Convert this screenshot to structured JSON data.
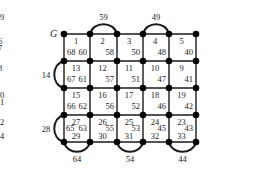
{
  "diagram": {
    "start_label": "G",
    "grid": {
      "cols_x": [
        64,
        90,
        117,
        143,
        169,
        196
      ],
      "rows_y": [
        34,
        61,
        88,
        115,
        142
      ]
    },
    "cells": [
      {
        "row": 0,
        "col": 0,
        "labels": [
          {
            "t": "1",
            "pos": "top"
          },
          {
            "t": "68",
            "pos": "bl"
          },
          {
            "t": "60",
            "pos": "br"
          }
        ]
      },
      {
        "row": 0,
        "col": 1,
        "labels": [
          {
            "t": "2",
            "pos": "top"
          },
          {
            "t": "58",
            "pos": "br"
          }
        ]
      },
      {
        "row": 0,
        "col": 2,
        "labels": [
          {
            "t": "3",
            "pos": "top"
          },
          {
            "t": "50",
            "pos": "br"
          }
        ]
      },
      {
        "row": 0,
        "col": 3,
        "labels": [
          {
            "t": "4",
            "pos": "top"
          },
          {
            "t": "48",
            "pos": "br"
          }
        ]
      },
      {
        "row": 0,
        "col": 4,
        "labels": [
          {
            "t": "5",
            "pos": "top"
          },
          {
            "t": "40",
            "pos": "br"
          }
        ]
      },
      {
        "row": 0,
        "col": 5,
        "labels": [
          {
            "t": "6",
            "pos": "top"
          },
          {
            "t": "38",
            "pos": "br"
          }
        ]
      },
      {
        "row": 1,
        "col": 0,
        "labels": [
          {
            "t": "13",
            "pos": "top"
          },
          {
            "t": "67",
            "pos": "bl"
          },
          {
            "t": "61",
            "pos": "br"
          }
        ]
      },
      {
        "row": 1,
        "col": 1,
        "labels": [
          {
            "t": "12",
            "pos": "top"
          },
          {
            "t": "57",
            "pos": "br"
          }
        ]
      },
      {
        "row": 1,
        "col": 2,
        "labels": [
          {
            "t": "11",
            "pos": "top"
          },
          {
            "t": "51",
            "pos": "br"
          }
        ]
      },
      {
        "row": 1,
        "col": 3,
        "labels": [
          {
            "t": "10",
            "pos": "top"
          },
          {
            "t": "47",
            "pos": "br"
          }
        ]
      },
      {
        "row": 1,
        "col": 4,
        "labels": [
          {
            "t": "9",
            "pos": "top"
          },
          {
            "t": "41",
            "pos": "br"
          }
        ]
      },
      {
        "row": 1,
        "col": 5,
        "labels": [
          {
            "t": "8",
            "pos": "top"
          },
          {
            "t": "37",
            "pos": "br"
          }
        ]
      },
      {
        "row": 2,
        "col": 0,
        "labels": [
          {
            "t": "15",
            "pos": "top"
          },
          {
            "t": "66",
            "pos": "bl"
          },
          {
            "t": "62",
            "pos": "br"
          }
        ]
      },
      {
        "row": 2,
        "col": 1,
        "labels": [
          {
            "t": "16",
            "pos": "top"
          },
          {
            "t": "56",
            "pos": "br"
          }
        ]
      },
      {
        "row": 2,
        "col": 2,
        "labels": [
          {
            "t": "17",
            "pos": "top"
          },
          {
            "t": "52",
            "pos": "br"
          }
        ]
      },
      {
        "row": 2,
        "col": 3,
        "labels": [
          {
            "t": "18",
            "pos": "top"
          },
          {
            "t": "46",
            "pos": "br"
          }
        ]
      },
      {
        "row": 2,
        "col": 4,
        "labels": [
          {
            "t": "19",
            "pos": "top"
          },
          {
            "t": "42",
            "pos": "br"
          }
        ]
      },
      {
        "row": 2,
        "col": 5,
        "labels": [
          {
            "t": "20",
            "pos": "top"
          },
          {
            "t": "36",
            "pos": "br"
          }
        ]
      },
      {
        "row": 3,
        "col": 0,
        "labels": [
          {
            "t": "27",
            "pos": "top"
          },
          {
            "t": "65",
            "pos": "ml"
          },
          {
            "t": "63",
            "pos": "mr"
          },
          {
            "t": "29",
            "pos": "bot"
          }
        ]
      },
      {
        "row": 3,
        "col": 1,
        "labels": [
          {
            "t": "26",
            "pos": "top"
          },
          {
            "t": "55",
            "pos": "mr"
          },
          {
            "t": "30",
            "pos": "bot"
          }
        ]
      },
      {
        "row": 3,
        "col": 2,
        "labels": [
          {
            "t": "25",
            "pos": "top"
          },
          {
            "t": "53",
            "pos": "mr"
          },
          {
            "t": "31",
            "pos": "bot"
          }
        ]
      },
      {
        "row": 3,
        "col": 3,
        "labels": [
          {
            "t": "24",
            "pos": "top"
          },
          {
            "t": "45",
            "pos": "mr"
          },
          {
            "t": "32",
            "pos": "bot"
          }
        ]
      },
      {
        "row": 3,
        "col": 4,
        "labels": [
          {
            "t": "23",
            "pos": "top"
          },
          {
            "t": "43",
            "pos": "mr"
          },
          {
            "t": "33",
            "pos": "bot"
          }
        ]
      },
      {
        "row": 3,
        "col": 5,
        "labels": [
          {
            "t": "22",
            "pos": "top"
          },
          {
            "t": "35",
            "pos": "mr"
          },
          {
            "t": "34",
            "pos": "bot"
          }
        ]
      }
    ],
    "arcs": [
      {
        "label": "59",
        "side": "top",
        "from": [
          1,
          0
        ],
        "to": [
          2,
          0
        ]
      },
      {
        "label": "49",
        "side": "top",
        "from": [
          3,
          0
        ],
        "to": [
          4,
          0
        ]
      },
      {
        "label": "39",
        "side": "top",
        "from": [
          5,
          0
        ],
        "to": [
          6,
          0
        ]
      },
      {
        "label": "7",
        "side": "right",
        "from": [
          6,
          0
        ],
        "to": [
          6,
          1
        ]
      },
      {
        "label": "21",
        "side": "right",
        "from": [
          6,
          2
        ],
        "to": [
          6,
          3
        ]
      },
      {
        "label": "14",
        "side": "left",
        "from": [
          0,
          1
        ],
        "to": [
          0,
          2
        ]
      },
      {
        "label": "28",
        "side": "left",
        "from": [
          0,
          3
        ],
        "to": [
          0,
          4
        ]
      },
      {
        "label": "64",
        "side": "bottom",
        "from": [
          0,
          4
        ],
        "to": [
          1,
          4
        ]
      },
      {
        "label": "54",
        "side": "bottom",
        "from": [
          2,
          4
        ],
        "to": [
          3,
          4
        ]
      },
      {
        "label": "44",
        "side": "bottom",
        "from": [
          4,
          4
        ],
        "to": [
          5,
          4
        ]
      }
    ]
  }
}
